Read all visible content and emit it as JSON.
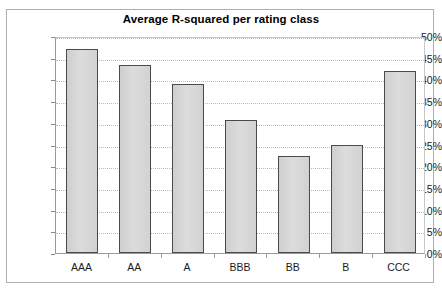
{
  "chart_data": {
    "type": "bar",
    "title": "Average R-squared per rating class",
    "xlabel": "",
    "ylabel": "",
    "categories": [
      "AAA",
      "AA",
      "A",
      "BBB",
      "BB",
      "B",
      "CCC"
    ],
    "values": [
      47.0,
      43.3,
      39.0,
      30.6,
      22.4,
      25.0,
      42.0
    ],
    "value_labels": [
      "47%",
      "43%",
      "39%",
      "31%",
      "22%",
      "25%",
      "42%"
    ],
    "ylim": [
      0,
      50
    ],
    "ytick_values": [
      0,
      5,
      10,
      15,
      20,
      25,
      30,
      35,
      40,
      45,
      50
    ],
    "ytick_labels": [
      "0%",
      "5%",
      "10%",
      "15%",
      "20%",
      "25%",
      "30%",
      "35%",
      "40%",
      "45%",
      "50%"
    ],
    "grid": true,
    "grid_axis": "y",
    "legend": false,
    "legend_position": "none",
    "series": [
      {
        "name": "Average R-squared",
        "values": [
          47.0,
          43.3,
          39.0,
          30.6,
          22.4,
          25.0,
          42.0
        ]
      }
    ]
  },
  "colors": {
    "bar_fill": "#d6d6d6",
    "bar_border": "#4a4a4a",
    "gridline": "#bcbcbc",
    "axis": "#9a9a9a",
    "frame": "#aeaeae",
    "text": "#1a1a1a",
    "background": "#ffffff"
  }
}
